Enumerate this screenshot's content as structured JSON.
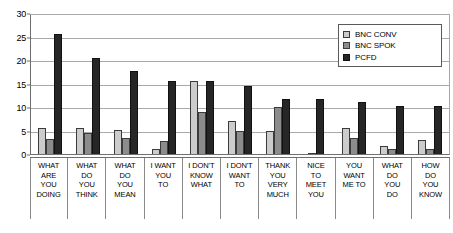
{
  "chart_data": {
    "type": "bar",
    "title": "",
    "subtitle": "",
    "xlabel": "",
    "ylabel": "",
    "ylim": [
      0,
      30
    ],
    "yticks": [
      0,
      5,
      10,
      15,
      20,
      25,
      30
    ],
    "grid": true,
    "legend_position": "top-right",
    "categories": [
      [
        "WHAT",
        "ARE",
        "YOU",
        "DOING"
      ],
      [
        "WHAT",
        "DO",
        "YOU",
        "THINK"
      ],
      [
        "WHAT",
        "DO",
        "YOU",
        "MEAN"
      ],
      [
        "I WANT",
        "YOU",
        "TO"
      ],
      [
        "I DON'T",
        "KNOW",
        "WHAT"
      ],
      [
        "I DON'T",
        "WANT",
        "TO"
      ],
      [
        "THANK",
        "YOU",
        "VERY",
        "MUCH"
      ],
      [
        "NICE",
        "TO",
        "MEET",
        "YOU"
      ],
      [
        "YOU",
        "WANT",
        "ME TO"
      ],
      [
        "WHAT",
        "DO",
        "YOU",
        "DO"
      ],
      [
        "HOW",
        "DO",
        "YOU",
        "KNOW"
      ]
    ],
    "categories_flat": [
      "WHAT ARE YOU DOING",
      "WHAT DO YOU THINK",
      "WHAT DO YOU MEAN",
      "I WANT YOU TO",
      "I DON'T KNOW WHAT",
      "I DON'T WANT TO",
      "THANK YOU VERY MUCH",
      "NICE TO MEET YOU",
      "YOU WANT ME TO",
      "WHAT DO YOU DO",
      "HOW DO YOU KNOW"
    ],
    "series": [
      {
        "name": "BNC CONV",
        "color": "#cccccc",
        "values": [
          5.5,
          5.5,
          5.2,
          1.0,
          15.5,
          7.0,
          5.0,
          0.3,
          5.5,
          1.6,
          2.9
        ]
      },
      {
        "name": "BNC SPOK",
        "color": "#8c8c8c",
        "values": [
          3.2,
          4.5,
          3.5,
          2.7,
          9.0,
          5.0,
          10.0,
          0.0,
          3.5,
          1.0,
          1.0
        ]
      },
      {
        "name": "PCFD",
        "color": "#262626",
        "values": [
          25.6,
          20.5,
          17.7,
          15.5,
          15.5,
          14.5,
          11.8,
          11.7,
          11.0,
          10.3,
          10.3
        ]
      }
    ]
  },
  "legend": {
    "items": [
      {
        "label": "BNC CONV"
      },
      {
        "label": "BNC SPOK"
      },
      {
        "label": "PCFD"
      }
    ]
  },
  "axis": {
    "y_tick_labels": [
      "30",
      "25",
      "20",
      "15",
      "10",
      "5",
      "0"
    ]
  }
}
